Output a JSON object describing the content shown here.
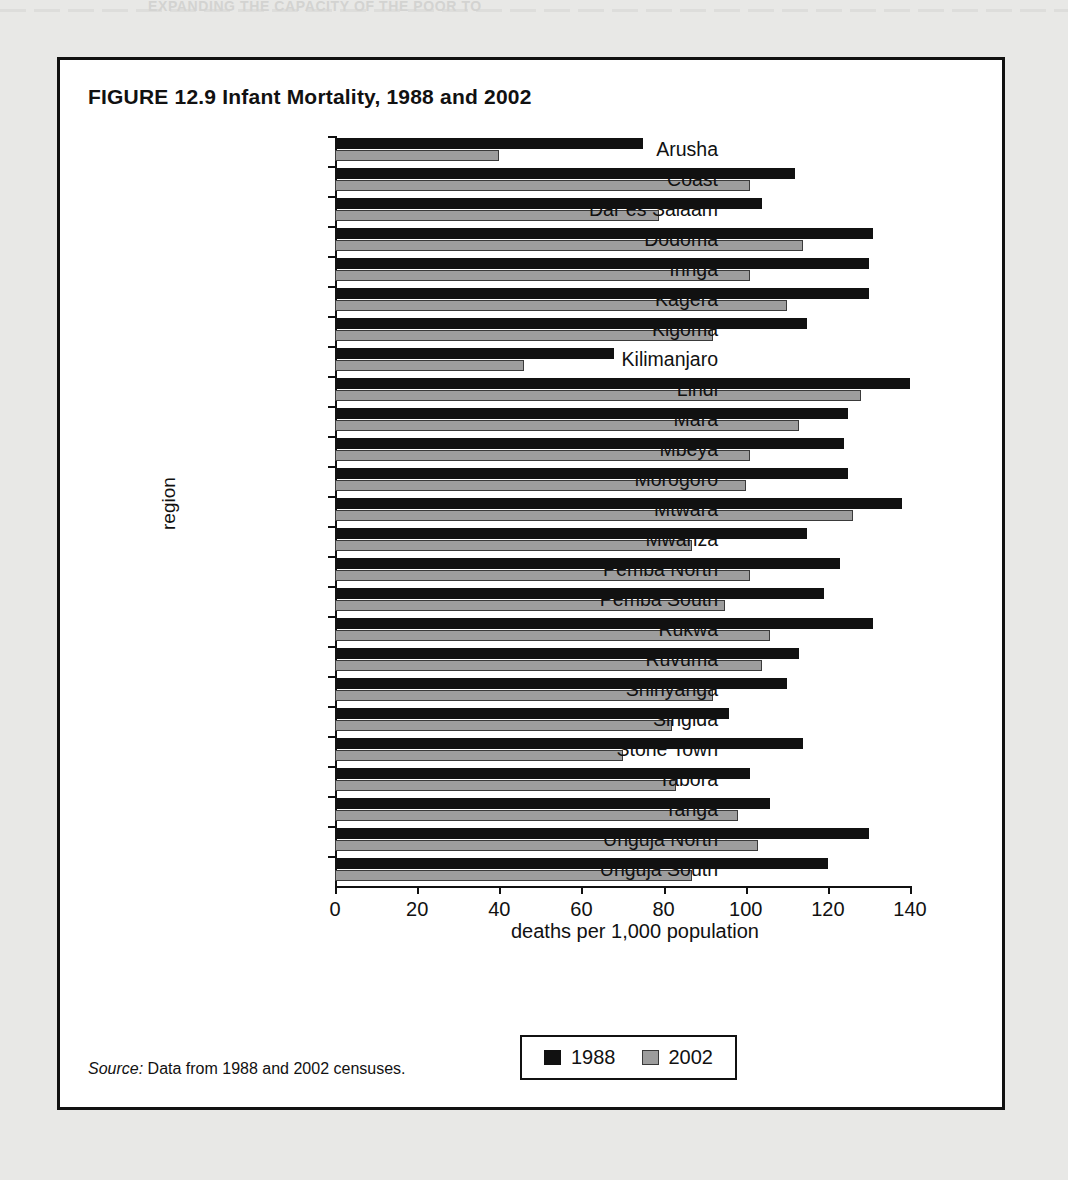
{
  "page_header": {
    "running_head": "EXPANDING THE CAPACITY OF THE POOR TO"
  },
  "figure": {
    "title": "FIGURE 12.9  Infant Mortality, 1988 and 2002",
    "source_word": "Source:",
    "source_text": " Data from 1988 and 2002 censuses."
  },
  "legend": {
    "items": [
      {
        "label": "1988",
        "color": "#111111",
        "swatch": "legend-swatch-1988"
      },
      {
        "label": "2002",
        "color": "#9d9d9d",
        "swatch": "legend-swatch-2002"
      }
    ]
  },
  "chart_data": {
    "type": "bar",
    "orientation": "horizontal",
    "title": "FIGURE 12.9  Infant Mortality, 1988 and 2002",
    "xlabel": "deaths per 1,000 population",
    "ylabel": "region",
    "xlim": [
      0,
      140
    ],
    "xticks": [
      0,
      20,
      40,
      60,
      80,
      100,
      120,
      140
    ],
    "xtick_labels": [
      "0",
      "20",
      "40",
      "60",
      "80",
      "100",
      "120",
      "140"
    ],
    "grid": false,
    "legend_position": "bottom",
    "categories": [
      "Arusha",
      "Coast",
      "Dar es Salaam",
      "Dodoma",
      "Iringa",
      "Kagera",
      "Kigoma",
      "Kilimanjaro",
      "Lindi",
      "Mara",
      "Mbeya",
      "Morogoro",
      "Mtwara",
      "Mwanza",
      "Pemba North",
      "Pemba South",
      "Rukwa",
      "Ruvuma",
      "Shinyanga",
      "Singida",
      "Stone Town",
      "Tabora",
      "Tanga",
      "Unguja North",
      "Unguja South"
    ],
    "series": [
      {
        "name": "1988",
        "color": "#111111",
        "values": [
          75,
          112,
          104,
          131,
          130,
          130,
          115,
          68,
          140,
          125,
          124,
          125,
          138,
          115,
          123,
          119,
          131,
          113,
          110,
          96,
          114,
          101,
          106,
          130,
          120
        ]
      },
      {
        "name": "2002",
        "color": "#9d9d9d",
        "values": [
          40,
          101,
          79,
          114,
          101,
          110,
          92,
          46,
          128,
          113,
          101,
          100,
          126,
          87,
          101,
          95,
          106,
          104,
          92,
          82,
          70,
          83,
          98,
          103,
          87
        ]
      }
    ]
  }
}
